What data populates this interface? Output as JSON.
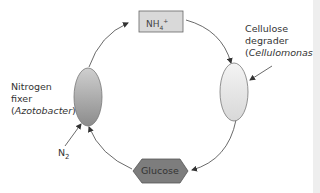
{
  "diagram": {
    "nodes": {
      "nh4": {
        "label_main": "NH",
        "label_sub": "4",
        "label_sup": "+",
        "shape": "rectangle",
        "fill": "#d9d9d9"
      },
      "cellulose_degrader": {
        "line1": "Cellulose",
        "line2": "degrader",
        "open": "(",
        "genus": "Cellulomonas",
        "close": ")",
        "shape": "ellipse",
        "fill": "#e8e8e8"
      },
      "nitrogen_fixer": {
        "line1": "Nitrogen",
        "line2": "fixer",
        "open": "(",
        "genus": "Azotobacter",
        "close": ")",
        "shape": "ellipse",
        "fill": "#a8a8a8"
      },
      "glucose": {
        "label": "Glucose",
        "shape": "hexagon",
        "fill": "#7a7a7a"
      },
      "n2": {
        "label_main": "N",
        "label_sub": "2"
      }
    },
    "edges": [
      {
        "from": "nitrogen_fixer",
        "to": "nh4"
      },
      {
        "from": "nh4",
        "to": "cellulose_degrader"
      },
      {
        "from": "cellulose_degrader",
        "to": "glucose"
      },
      {
        "from": "glucose",
        "to": "nitrogen_fixer"
      },
      {
        "from": "n2",
        "to": "nitrogen_fixer"
      }
    ]
  }
}
